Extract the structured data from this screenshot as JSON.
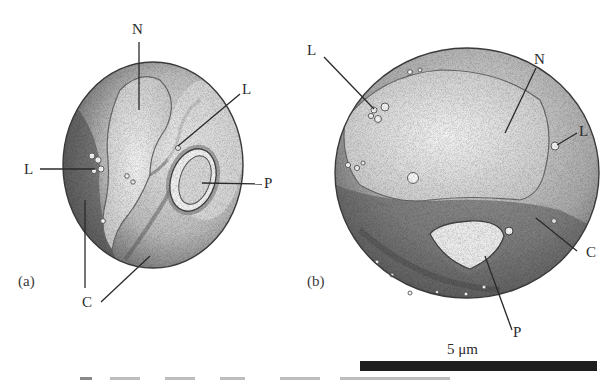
{
  "figure": {
    "panels": [
      {
        "id": "a",
        "panel_label": "(a)",
        "labels": {
          "nucleus": "N",
          "lipid_left": "L",
          "lipid_right": "L",
          "plastid": "P",
          "cytoplasm": "C"
        }
      },
      {
        "id": "b",
        "panel_label": "(b)",
        "labels": {
          "nucleus": "N",
          "lipid_left": "L",
          "lipid_right": "L",
          "plastid": "P",
          "cytoplasm": "C"
        }
      }
    ],
    "scale_bar": {
      "label": "5 μm",
      "color": "#1e1e1e"
    },
    "legend": {
      "N": "nucleus",
      "L": "lipid droplet",
      "P": "plastid",
      "C": "cytoplasm"
    }
  }
}
